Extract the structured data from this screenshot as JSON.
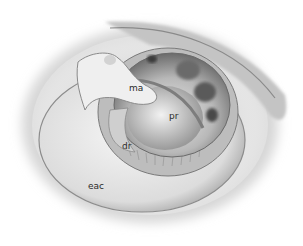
{
  "figure": {
    "labels": [
      {
        "id": "ma",
        "text": "ma",
        "x": 129,
        "y": 84
      },
      {
        "id": "pr",
        "text": "pr",
        "x": 169,
        "y": 112
      },
      {
        "id": "dr",
        "text": "dr",
        "x": 122,
        "y": 142
      },
      {
        "id": "eac",
        "text": "eac",
        "x": 88,
        "y": 182
      }
    ],
    "colors": {
      "background": "#ffffff",
      "skin_light": "#f2f2f2",
      "skin_mid": "#c8c8c8",
      "shadow": "#4a4a4a",
      "label": "#2a2a2a"
    }
  }
}
